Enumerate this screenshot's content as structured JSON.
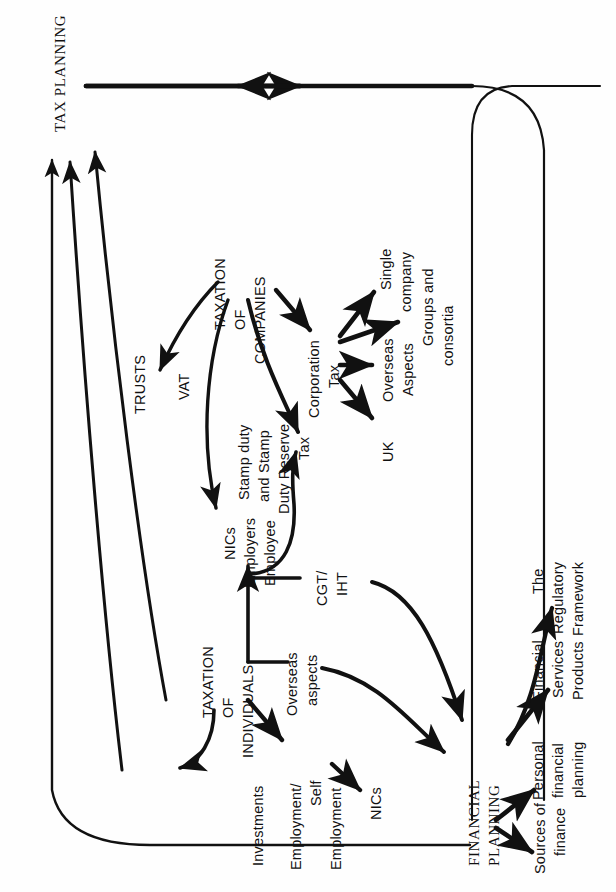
{
  "diagram": {
    "title_visible": false,
    "orientation": "rotated-90-ccw",
    "ink_color": "#111111",
    "background_color": "#fefefe",
    "nodes": {
      "tax_planning": "TAX PLANNING",
      "trusts": "TRUSTS",
      "vat": "VAT",
      "taxation_of_companies_l1": "TAXATION",
      "taxation_of_companies_l2": "OF",
      "taxation_of_companies_l3": "COMPANIES",
      "corporation_tax_l1": "Corporation",
      "corporation_tax_l2": "Tax",
      "single_company_l1": "Single",
      "single_company_l2": "company",
      "groups_consortia_l1": "Groups and",
      "groups_consortia_l2": "consortia",
      "overseas_aspects_l1": "Overseas",
      "overseas_aspects_l2": "Aspects",
      "uk": "UK",
      "stamp_duty_l1": "Stamp duty",
      "stamp_duty_l2": "and Stamp",
      "stamp_duty_l3": "Duty Reserve",
      "stamp_duty_l4": "Tax",
      "nics_top_l1": "NICs",
      "nics_top_l2": "Employers",
      "nics_top_l3": "Employee",
      "cgt_iht_l1": "CGT/",
      "cgt_iht_l2": "IHT",
      "taxation_of_individuals_l1": "TAXATION",
      "taxation_of_individuals_l2": "OF",
      "taxation_of_individuals_l3": "INDIVIDUALS",
      "overseas_aspects_ind_l1": "Overseas",
      "overseas_aspects_ind_l2": "aspects",
      "investments": "Investments",
      "employment_l1": "Employment/",
      "employment_l2": "Self",
      "employment_l3": "Employment",
      "nics_bottom": "NICs",
      "financial_planning_l1": "FINANCIAL",
      "financial_planning_l2": "PLANNING",
      "sources_of_finance_l1": "Sources of",
      "sources_of_finance_l2": "finance",
      "personal_financial_planning_l1": "Personal",
      "personal_financial_planning_l2": "financial",
      "personal_financial_planning_l3": "planning",
      "financial_services_products_l1": "Financial",
      "financial_services_products_l2": "Services",
      "financial_services_products_l3": "Products",
      "regulatory_framework_l1": "The",
      "regulatory_framework_l2": "Regulatory",
      "regulatory_framework_l3": "Framework"
    },
    "edges": [
      {
        "from": "FINANCIAL PLANNING",
        "to": "TAX PLANNING",
        "style": "outer-loop-top"
      },
      {
        "from": "TAXATION OF INDIVIDUALS",
        "to": "TAX PLANNING",
        "style": "long-straight"
      },
      {
        "from": "TRUSTS",
        "to": "TAX PLANNING",
        "style": "curve"
      },
      {
        "from": "VAT",
        "to": "TAX PLANNING",
        "style": "curve"
      },
      {
        "from": "TAXATION OF COMPANIES",
        "to": "VAT",
        "style": "curve"
      },
      {
        "from": "TAXATION OF COMPANIES",
        "to": "Corporation Tax",
        "style": "straight"
      },
      {
        "from": "TAXATION OF COMPANIES",
        "to": "Stamp duty and Stamp Duty Reserve Tax",
        "style": "curve"
      },
      {
        "from": "TAXATION OF COMPANIES",
        "to": "NICs Employers Employee",
        "style": "curve"
      },
      {
        "from": "Corporation Tax",
        "to": "Single company",
        "style": "straight"
      },
      {
        "from": "Corporation Tax",
        "to": "Groups and consortia",
        "style": "straight"
      },
      {
        "from": "Corporation Tax",
        "to": "Overseas Aspects",
        "style": "straight"
      },
      {
        "from": "Corporation Tax",
        "to": "UK",
        "style": "straight"
      },
      {
        "from": "TAXATION OF INDIVIDUALS",
        "to": "NICs Employers Employee",
        "style": "straight"
      },
      {
        "from": "TAXATION OF INDIVIDUALS",
        "to": "Stamp duty and Stamp Duty Reserve Tax",
        "style": "curve"
      },
      {
        "from": "TAXATION OF INDIVIDUALS",
        "to": "CGT/IHT",
        "style": "branch"
      },
      {
        "from": "TAXATION OF INDIVIDUALS",
        "to": "Overseas aspects",
        "style": "branch"
      },
      {
        "from": "TAXATION OF INDIVIDUALS",
        "to": "Investments",
        "style": "curve"
      },
      {
        "from": "TAXATION OF INDIVIDUALS",
        "to": "Employment/Self Employment",
        "style": "straight"
      },
      {
        "from": "Employment/Self Employment",
        "to": "NICs",
        "style": "straight"
      },
      {
        "from": "CGT/IHT",
        "to": "FINANCIAL PLANNING",
        "style": "curve"
      },
      {
        "from": "Overseas aspects",
        "to": "FINANCIAL PLANNING",
        "style": "curve"
      },
      {
        "from": "FINANCIAL PLANNING",
        "to": "Sources of finance",
        "style": "straight"
      },
      {
        "from": "FINANCIAL PLANNING",
        "to": "Personal financial planning",
        "style": "straight"
      },
      {
        "from": "FINANCIAL PLANNING",
        "to": "Financial Services Products",
        "style": "straight"
      },
      {
        "from": "FINANCIAL PLANNING",
        "to": "The Regulatory Framework",
        "style": "curve"
      }
    ]
  }
}
